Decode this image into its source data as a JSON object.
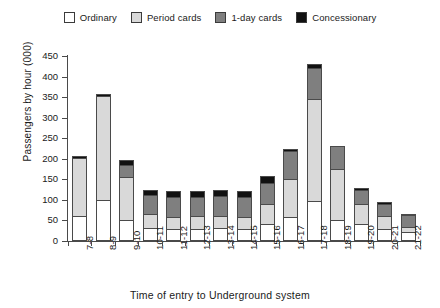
{
  "chart_data": {
    "type": "bar",
    "title": "",
    "xlabel": "Time of entry to Underground system",
    "ylabel": "Passengers by hour (000)",
    "ylim": [
      0,
      450
    ],
    "yticks": [
      0,
      50,
      100,
      150,
      200,
      250,
      300,
      350,
      400,
      450
    ],
    "grid": false,
    "stacked": true,
    "legend_position": "top-center",
    "categories": [
      "7-8",
      "8-9",
      "9-10",
      "10-11",
      "11-12",
      "12-13",
      "13-14",
      "14-15",
      "15-16",
      "16-17",
      "17-18",
      "18-19",
      "19-20",
      "20-21",
      "21-22"
    ],
    "series": [
      {
        "name": "Ordinary",
        "color": "#ffffff",
        "values": [
          62,
          100,
          50,
          32,
          30,
          30,
          32,
          30,
          42,
          58,
          98,
          50,
          42,
          30,
          22
        ]
      },
      {
        "name": "Period cards",
        "color": "#d9d9d9",
        "values": [
          140,
          252,
          105,
          33,
          28,
          30,
          30,
          28,
          48,
          92,
          247,
          125,
          48,
          30,
          12
        ]
      },
      {
        "name": "1-day cards",
        "color": "#7f7f7f",
        "values": [
          0,
          0,
          30,
          47,
          50,
          48,
          48,
          50,
          52,
          68,
          75,
          57,
          35,
          30,
          30
        ]
      },
      {
        "name": "Concessionary",
        "color": "#111111",
        "values": [
          5,
          6,
          13,
          13,
          14,
          14,
          13,
          14,
          15,
          7,
          10,
          0,
          5,
          5,
          2
        ]
      }
    ],
    "totals": [
      207,
      358,
      198,
      125,
      122,
      122,
      123,
      122,
      157,
      225,
      430,
      232,
      130,
      95,
      66
    ]
  },
  "legend": {
    "items": [
      {
        "label": "Ordinary",
        "color": "#ffffff"
      },
      {
        "label": "Period cards",
        "color": "#d9d9d9"
      },
      {
        "label": "1-day cards",
        "color": "#7f7f7f"
      },
      {
        "label": "Concessionary",
        "color": "#111111"
      }
    ]
  }
}
